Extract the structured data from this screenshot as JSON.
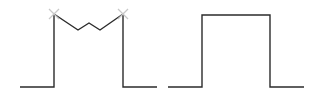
{
  "diagram": {
    "colors": {
      "line": "#2b2b2b",
      "marker": "#c8c8c8",
      "background": "#ffffff"
    },
    "shapes": [
      {
        "name": "notched-pulse",
        "points": [
          [
            20,
            87
          ],
          [
            54,
            87
          ],
          [
            54,
            14
          ],
          [
            78,
            30
          ],
          [
            89,
            23
          ],
          [
            100,
            30
          ],
          [
            123,
            14
          ],
          [
            123,
            87
          ],
          [
            157,
            87
          ]
        ],
        "markers": [
          {
            "type": "x",
            "x": 54,
            "y": 14
          },
          {
            "type": "x",
            "x": 123,
            "y": 14
          }
        ]
      },
      {
        "name": "rectangular-pulse",
        "points": [
          [
            168,
            87
          ],
          [
            202,
            87
          ],
          [
            202,
            15
          ],
          [
            270,
            15
          ],
          [
            270,
            87
          ],
          [
            304,
            87
          ]
        ],
        "markers": []
      }
    ]
  }
}
